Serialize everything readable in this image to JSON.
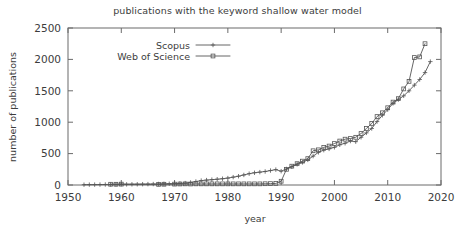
{
  "chart_data": {
    "type": "line",
    "title": "publications with the keyword shallow water model",
    "xlabel": "year",
    "ylabel": "number of publications",
    "xlim": [
      1950,
      2020
    ],
    "ylim": [
      0,
      2500
    ],
    "xticks": [
      1950,
      1960,
      1970,
      1980,
      1990,
      2000,
      2010,
      2020
    ],
    "yticks": [
      0,
      500,
      1000,
      1500,
      2000,
      2500
    ],
    "grid": false,
    "legend_position": "top-left-inside",
    "series": [
      {
        "name": "Scopus",
        "marker": "plus",
        "x": [
          1953,
          1954,
          1955,
          1956,
          1957,
          1958,
          1959,
          1960,
          1961,
          1962,
          1963,
          1964,
          1965,
          1966,
          1967,
          1968,
          1969,
          1970,
          1971,
          1972,
          1973,
          1974,
          1975,
          1976,
          1977,
          1978,
          1979,
          1980,
          1981,
          1982,
          1983,
          1984,
          1985,
          1986,
          1987,
          1988,
          1989,
          1990,
          1991,
          1992,
          1993,
          1994,
          1995,
          1996,
          1997,
          1998,
          1999,
          2000,
          2001,
          2002,
          2003,
          2004,
          2005,
          2006,
          2007,
          2008,
          2009,
          2010,
          2011,
          2012,
          2013,
          2014,
          2015,
          2016,
          2017,
          2018
        ],
        "values": [
          5,
          6,
          6,
          7,
          8,
          9,
          10,
          12,
          10,
          11,
          12,
          13,
          14,
          15,
          16,
          18,
          20,
          22,
          25,
          30,
          40,
          55,
          70,
          78,
          85,
          92,
          100,
          110,
          125,
          140,
          160,
          180,
          195,
          205,
          215,
          230,
          245,
          220,
          255,
          290,
          330,
          360,
          400,
          460,
          520,
          555,
          575,
          600,
          640,
          665,
          700,
          690,
          760,
          830,
          900,
          1010,
          1110,
          1200,
          1300,
          1360,
          1420,
          1500,
          1590,
          1680,
          1790,
          1965
        ]
      },
      {
        "name": "Web of Science",
        "marker": "square",
        "x": [
          1958,
          1959,
          1960,
          1967,
          1968,
          1970,
          1971,
          1972,
          1973,
          1974,
          1975,
          1976,
          1977,
          1978,
          1979,
          1980,
          1981,
          1982,
          1983,
          1984,
          1985,
          1986,
          1987,
          1988,
          1989,
          1990,
          1991,
          1992,
          1993,
          1994,
          1995,
          1996,
          1997,
          1998,
          1999,
          2000,
          2001,
          2002,
          2003,
          2004,
          2005,
          2006,
          2007,
          2008,
          2009,
          2010,
          2011,
          2012,
          2013,
          2014,
          2015,
          2016,
          2017
        ],
        "values": [
          12,
          12,
          14,
          10,
          12,
          14,
          16,
          18,
          16,
          18,
          18,
          18,
          18,
          18,
          18,
          18,
          18,
          18,
          18,
          18,
          18,
          18,
          20,
          22,
          25,
          60,
          250,
          300,
          340,
          380,
          420,
          545,
          560,
          600,
          620,
          660,
          700,
          730,
          740,
          760,
          820,
          900,
          980,
          1090,
          1150,
          1230,
          1320,
          1375,
          1530,
          1650,
          2030,
          2040,
          2250
        ]
      }
    ]
  }
}
